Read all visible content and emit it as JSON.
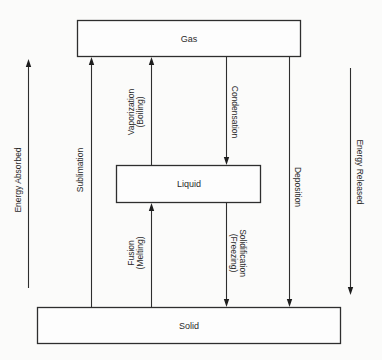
{
  "diagram": {
    "colors": {
      "background": "#fbfbfa",
      "stroke": "#2e2e2e",
      "text": "#2a2a2a"
    },
    "states": {
      "gas": "Gas",
      "liquid": "Liquid",
      "solid": "Solid"
    },
    "transitions": {
      "sublimation": {
        "label": "Sublimation",
        "from": "Solid",
        "to": "Gas",
        "direction": "up"
      },
      "vaporization": {
        "label": "Vaporization",
        "sub": "(Boiling)",
        "from": "Liquid",
        "to": "Gas",
        "direction": "up"
      },
      "condensation": {
        "label": "Condensation",
        "from": "Gas",
        "to": "Liquid",
        "direction": "down"
      },
      "deposition": {
        "label": "Deposition",
        "from": "Gas",
        "to": "Solid",
        "direction": "down"
      },
      "fusion": {
        "label": "Fusion",
        "sub": "(Melting)",
        "from": "Solid",
        "to": "Liquid",
        "direction": "up"
      },
      "solidification": {
        "label": "Solidification",
        "sub": "(Freezing)",
        "from": "Liquid",
        "to": "Solid",
        "direction": "down"
      }
    },
    "energy": {
      "absorbed": {
        "label": "Energy Absorbed",
        "direction": "up"
      },
      "released": {
        "label": "Energy Released",
        "direction": "down"
      }
    }
  }
}
